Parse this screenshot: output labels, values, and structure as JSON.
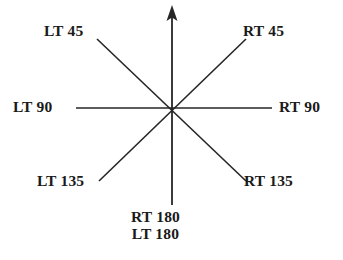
{
  "diagram": {
    "center": {
      "x": 172,
      "y": 108
    },
    "stroke_color": "#262626",
    "background_color": "#ffffff",
    "text_color": "#1a1a1a",
    "axes": [
      {
        "name": "vertical-axis",
        "has_arrowhead": true,
        "arrow_end": "top",
        "x1": 172,
        "y1": 8,
        "x2": 172,
        "y2": 205
      },
      {
        "name": "horizontal-axis",
        "has_arrowhead": false,
        "x1": 76,
        "y1": 108,
        "x2": 272,
        "y2": 108
      },
      {
        "name": "diagonal-nw-se",
        "has_arrowhead": false,
        "x1": 97,
        "y1": 39,
        "x2": 245,
        "y2": 180
      },
      {
        "name": "diagonal-ne-sw",
        "has_arrowhead": false,
        "x1": 245,
        "y1": 39,
        "x2": 100,
        "y2": 180
      }
    ],
    "labels": [
      {
        "id": "lt45",
        "text": "LT 45",
        "direction": "upper-left",
        "angle_deg": 45
      },
      {
        "id": "rt45",
        "text": "RT 45",
        "direction": "upper-right",
        "angle_deg": 45
      },
      {
        "id": "lt90",
        "text": "LT 90",
        "direction": "left",
        "angle_deg": 90
      },
      {
        "id": "rt90",
        "text": "RT 90",
        "direction": "right",
        "angle_deg": 90
      },
      {
        "id": "lt135",
        "text": "LT 135",
        "direction": "lower-left",
        "angle_deg": 135
      },
      {
        "id": "rt135",
        "text": "RT 135",
        "direction": "lower-right",
        "angle_deg": 135
      },
      {
        "id": "rt180",
        "text": "RT 180",
        "direction": "down",
        "angle_deg": 180
      },
      {
        "id": "lt180",
        "text": "LT 180",
        "direction": "down",
        "angle_deg": 180
      }
    ]
  }
}
